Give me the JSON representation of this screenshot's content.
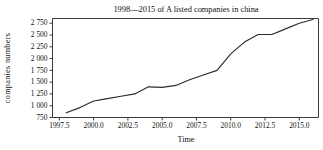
{
  "chart_data": {
    "type": "line",
    "title": "1998—2015 of A listed companies in china",
    "xlabel": "Time",
    "ylabel": "companies  numbers",
    "xlim": [
      1997.0,
      2016.4
    ],
    "ylim": [
      750,
      2850
    ],
    "grid": false,
    "legend": null,
    "xticks": [
      "1997.5",
      "2000.0",
      "2002.5",
      "2005.0",
      "2007.5",
      "2010.0",
      "2012.5",
      "2015.0"
    ],
    "xtick_values": [
      1997.5,
      2000.0,
      2002.5,
      2005.0,
      2007.5,
      2010.0,
      2012.5,
      2015.0
    ],
    "yticks": [
      "750",
      "1 000",
      "1 250",
      "1 500",
      "1 750",
      "2 000",
      "2 250",
      "2 500",
      "2 750"
    ],
    "ytick_values": [
      750,
      1000,
      1250,
      1500,
      1750,
      2000,
      2250,
      2500,
      2750
    ],
    "series": [
      {
        "name": "A listed companies",
        "color": "#2b2b2b",
        "x": [
          1998,
          1999,
          2000,
          2001,
          2002,
          2003,
          2004,
          2005,
          2006,
          2007,
          2008,
          2009,
          2010,
          2011,
          2012,
          2013,
          2014,
          2015,
          2016
        ],
        "values": [
          850,
          960,
          1100,
          1150,
          1200,
          1250,
          1400,
          1390,
          1430,
          1550,
          1650,
          1750,
          2100,
          2350,
          2510,
          2510,
          2630,
          2750,
          2830
        ]
      }
    ]
  },
  "figure": {
    "title": "1998—2015 of A listed companies in china",
    "xlabel": "Time",
    "ylabel": "companies  numbers"
  }
}
